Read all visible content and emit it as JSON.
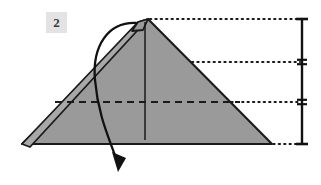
{
  "figure": {
    "kind": "origami-fold-diagram",
    "step_label": "2",
    "width": 321,
    "height": 185,
    "background_color": "#ffffff"
  },
  "step_badge": {
    "label": "2",
    "background_color": "#e3e3e3",
    "text_color": "#3a3a3a"
  },
  "colors": {
    "paper_fill": "#9a9a9a",
    "paper_fill_light": "#a8a8a8",
    "outline": "#1a1a1a",
    "dotted_guide": "#1a1a1a",
    "dashed_crease": "#1a1a1a",
    "arrow": "#111111",
    "measure_bar": "#111111"
  },
  "shapes": {
    "main_triangle": {
      "name": "folded-paper-triangle",
      "points": "22,144 148,19 272,144"
    },
    "upper_flap": {
      "name": "upper-left-flap",
      "points": "22,144 138,22 148,19 30,147"
    },
    "apex_notch": {
      "name": "apex-double-peak",
      "points": "132,31 138,22 148,19 143,30"
    }
  },
  "creases": {
    "vertical_center": {
      "name": "vertical-center-crease",
      "x1": 145,
      "y1": 22,
      "x2": 145,
      "y2": 140,
      "style": "solid"
    },
    "horizontal_fold": {
      "name": "horizontal-fold-crease",
      "x1": 55,
      "y1": 102,
      "x2": 240,
      "y2": 102,
      "style": "dashed",
      "dash_pattern": "7,5"
    }
  },
  "guide_lines": [
    {
      "name": "guide-line-apex",
      "x1": 150,
      "y1": 19,
      "x2": 300,
      "y2": 19
    },
    {
      "name": "guide-line-flap-edge",
      "x1": 192,
      "y1": 62,
      "x2": 300,
      "y2": 62
    },
    {
      "name": "guide-line-fold",
      "x1": 226,
      "y1": 102,
      "x2": 300,
      "y2": 102
    },
    {
      "name": "guide-line-base",
      "x1": 268,
      "y1": 144,
      "x2": 300,
      "y2": 144
    }
  ],
  "measure_bracket": {
    "name": "proportion-measure-bracket",
    "axis_x": 302,
    "segments": [
      {
        "name": "measure-segment-top",
        "y_top": 19,
        "y_bottom": 62
      },
      {
        "name": "measure-segment-middle",
        "y_top": 62,
        "y_bottom": 102
      },
      {
        "name": "measure-segment-bottom",
        "y_top": 102,
        "y_bottom": 144
      }
    ],
    "tick_half_width": 6,
    "divider_half_width": 5
  },
  "fold_arrow": {
    "name": "fold-over-arrow",
    "path": "M 136,23 C 108,22 92,46 95,80 C 98,116 110,140 118,164",
    "head_points": "118,172 112,152 126,158",
    "direction": "down",
    "meaning": "fold-front-flap-down"
  }
}
